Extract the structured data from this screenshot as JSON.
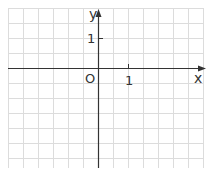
{
  "diagram": {
    "type": "coordinate-plane",
    "grid": {
      "spacing_px": 15,
      "color": "#dcdcdc",
      "cols": 14,
      "rows": 11
    },
    "axes": {
      "color": "#333333"
    },
    "labels": {
      "x_axis": "x",
      "y_axis": "y",
      "origin": "O",
      "x_unit": "1",
      "y_unit": "1"
    }
  }
}
